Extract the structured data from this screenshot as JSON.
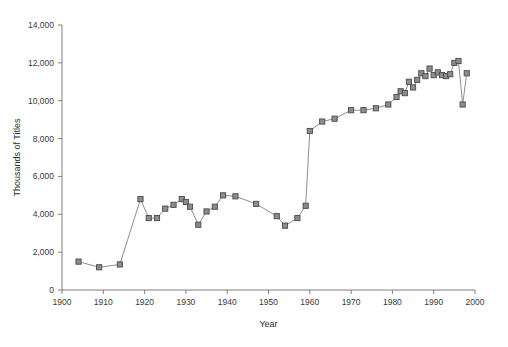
{
  "chart_data": {
    "type": "line",
    "title": "",
    "xlabel": "Year",
    "ylabel": "Thousands of Titles",
    "xlim": [
      1900,
      2000
    ],
    "ylim": [
      0,
      14000
    ],
    "xticks": [
      1900,
      1910,
      1920,
      1930,
      1940,
      1950,
      1960,
      1970,
      1980,
      1990,
      2000
    ],
    "xtick_labels": [
      "1900",
      "1910",
      "1920",
      "1930",
      "1940",
      "1950",
      "1960",
      "1970",
      "1980",
      "1990",
      "2000"
    ],
    "yticks": [
      0,
      2000,
      4000,
      6000,
      8000,
      10000,
      12000,
      14000
    ],
    "ytick_labels": [
      "0",
      "2,000",
      "4,000",
      "6,000",
      "8,000",
      "10,000",
      "12,000",
      "14,000"
    ],
    "grid": false,
    "legend": null,
    "marker": "square",
    "marker_color": "#8c8c8c",
    "marker_edge_color": "#4a4a4a",
    "line_color": "#808080",
    "series": [
      {
        "name": "Titles",
        "x": [
          1904,
          1909,
          1914,
          1919,
          1921,
          1923,
          1925,
          1927,
          1929,
          1930,
          1931,
          1933,
          1935,
          1937,
          1939,
          1942,
          1947,
          1952,
          1954,
          1957,
          1959,
          1960,
          1963,
          1966,
          1970,
          1973,
          1976,
          1979,
          1981,
          1982,
          1983,
          1984,
          1985,
          1986,
          1987,
          1988,
          1989,
          1990,
          1991,
          1992,
          1993,
          1994,
          1995,
          1996,
          1997,
          1998
        ],
        "y": [
          1500,
          1200,
          1350,
          4800,
          3800,
          3800,
          4300,
          4500,
          4800,
          4650,
          4400,
          3450,
          4150,
          4400,
          5000,
          4950,
          4550,
          3900,
          3400,
          3800,
          4450,
          8400,
          8900,
          9050,
          9500,
          9500,
          9600,
          9800,
          10200,
          10500,
          10400,
          11000,
          10700,
          11100,
          11450,
          11300,
          11700,
          11350,
          11500,
          11350,
          11300,
          11400,
          12000,
          12100,
          9800,
          11450
        ]
      }
    ]
  },
  "axes": {
    "x_axis_name": "x-axis",
    "y_axis_name": "y-axis"
  }
}
